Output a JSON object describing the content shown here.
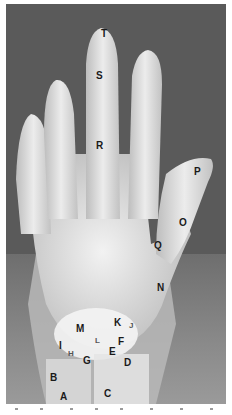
{
  "image": {
    "subject": "hand-xray",
    "background_color": "#5a5a5a",
    "bone_color": "#e8e8e8",
    "border_color": "#ffffff"
  },
  "labels": [
    {
      "text": "T",
      "x": 101,
      "y": 33
    },
    {
      "text": "S",
      "x": 96,
      "y": 75
    },
    {
      "text": "R",
      "x": 96,
      "y": 145
    },
    {
      "text": "P",
      "x": 194,
      "y": 171
    },
    {
      "text": "O",
      "x": 179,
      "y": 222
    },
    {
      "text": "Q",
      "x": 154,
      "y": 245
    },
    {
      "text": "N",
      "x": 157,
      "y": 287
    },
    {
      "text": "K",
      "x": 114,
      "y": 322
    },
    {
      "text": "J",
      "x": 129,
      "y": 325
    },
    {
      "text": "M",
      "x": 76,
      "y": 328
    },
    {
      "text": "L",
      "x": 95,
      "y": 340
    },
    {
      "text": "F",
      "x": 118,
      "y": 341
    },
    {
      "text": "I",
      "x": 59,
      "y": 345
    },
    {
      "text": "H",
      "x": 68,
      "y": 353
    },
    {
      "text": "E",
      "x": 109,
      "y": 351
    },
    {
      "text": "G",
      "x": 83,
      "y": 360
    },
    {
      "text": "D",
      "x": 124,
      "y": 362
    },
    {
      "text": "B",
      "x": 50,
      "y": 377
    },
    {
      "text": "A",
      "x": 60,
      "y": 396
    },
    {
      "text": "C",
      "x": 104,
      "y": 393
    }
  ]
}
